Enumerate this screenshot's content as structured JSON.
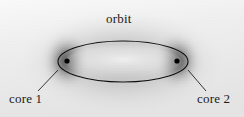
{
  "figure": {
    "kind": "scanned-diagram",
    "width": 244,
    "height": 117,
    "background_color": "#f0f0f0",
    "ink_color": "#1a1a1a"
  },
  "labels": {
    "orbit": "orbit",
    "core1": "core 1",
    "core2": "core 2"
  },
  "diagram": {
    "orbit_ellipse": {
      "center_x": 123,
      "center_y": 61.5,
      "radius_x": 65,
      "radius_y": 20.5,
      "stroke_color": "#111111",
      "stroke_width": 1.1
    },
    "cores": [
      {
        "name": "core 1",
        "x": 67,
        "y": 61,
        "dot_radius": 2.6,
        "cloud_radius_x": 26,
        "cloud_radius_y": 30,
        "dot_color": "#000000"
      },
      {
        "name": "core 2",
        "x": 177,
        "y": 61,
        "dot_radius": 2.6,
        "cloud_radius_x": 26,
        "cloud_radius_y": 30,
        "dot_color": "#000000"
      }
    ],
    "leaders": [
      {
        "name": "orbit-leader",
        "x1": 122,
        "y1": 29,
        "x2": 122,
        "y2": 42
      },
      {
        "name": "core1-leader",
        "x1": 38,
        "y1": 91,
        "x2": 58,
        "y2": 70
      },
      {
        "name": "core2-leader",
        "x1": 188,
        "y1": 70,
        "x2": 206,
        "y2": 91
      }
    ]
  }
}
